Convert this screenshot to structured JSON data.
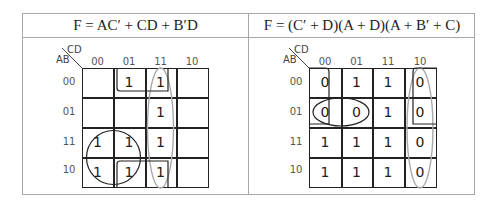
{
  "left": {
    "title": "F = AC′ + CD + B′D",
    "var_cols": "CD",
    "var_rows": "AB",
    "col_labels": [
      "00",
      "01",
      "11",
      "10"
    ],
    "row_labels": [
      "00",
      "01",
      "11",
      "10"
    ],
    "cells": [
      [
        "",
        "1",
        "1",
        ""
      ],
      [
        "",
        "",
        "1",
        ""
      ],
      [
        "1",
        "1",
        "1",
        ""
      ],
      [
        "1",
        "1",
        "1",
        ""
      ]
    ],
    "groups": [
      {
        "term": "AC′",
        "shape": "circle",
        "color": "#222222"
      },
      {
        "term": "CD",
        "shape": "ellipse",
        "color": "#aaaaaa"
      },
      {
        "term": "B′D",
        "shape": "wrap-bracket",
        "color": "#222222"
      }
    ]
  },
  "right": {
    "title": "F = (C′ + D)(A + D)(A + B′ + C)",
    "var_cols": "CD",
    "var_rows": "AB",
    "col_labels": [
      "00",
      "01",
      "11",
      "10"
    ],
    "row_labels": [
      "00",
      "01",
      "11",
      "10"
    ],
    "cells": [
      [
        "0",
        "1",
        "1",
        "0"
      ],
      [
        "0",
        "0",
        "1",
        "0"
      ],
      [
        "1",
        "1",
        "1",
        "0"
      ],
      [
        "1",
        "1",
        "1",
        "0"
      ]
    ],
    "groups": [
      {
        "term": "C′ + D",
        "shape": "ellipse",
        "color": "#aaaaaa"
      },
      {
        "term": "A + B′ + C",
        "shape": "ellipse",
        "color": "#222222"
      },
      {
        "term": "A + D",
        "shape": "wrap-bracket",
        "color": "#222222"
      }
    ]
  }
}
